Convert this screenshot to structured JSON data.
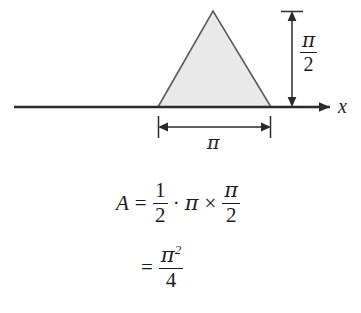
{
  "figure": {
    "axis": {
      "x_label": "x",
      "arrow_icon": "right-arrow-icon"
    },
    "shape": {
      "kind": "triangle",
      "fill_color": "#e9e9e9",
      "stroke_color": "#5a5a5a",
      "base_label": "π",
      "height_label_numerator": "π",
      "height_label_denominator": "2"
    },
    "dimensions": {
      "height": {
        "name": "vertical-dimension-pi-over-2",
        "numerator": "π",
        "denominator": "2"
      },
      "base": {
        "name": "horizontal-dimension-pi",
        "value": "π"
      }
    }
  },
  "equations": {
    "line1": {
      "lhs": "A",
      "relation": "=",
      "half_numerator": "1",
      "half_denominator": "2",
      "dot_operator": "·",
      "pi_symbol": "π",
      "times_operator": "×",
      "pi_half_numerator": "π",
      "pi_half_denominator": "2"
    },
    "line2": {
      "relation": "=",
      "numerator_base": "π",
      "numerator_exponent": "2",
      "denominator": "4"
    }
  },
  "colors": {
    "ink": "#1d1d1d",
    "triangle_fill": "#e9e9e9",
    "triangle_stroke": "#5a5a5a",
    "axis": "#2a2a2a"
  }
}
